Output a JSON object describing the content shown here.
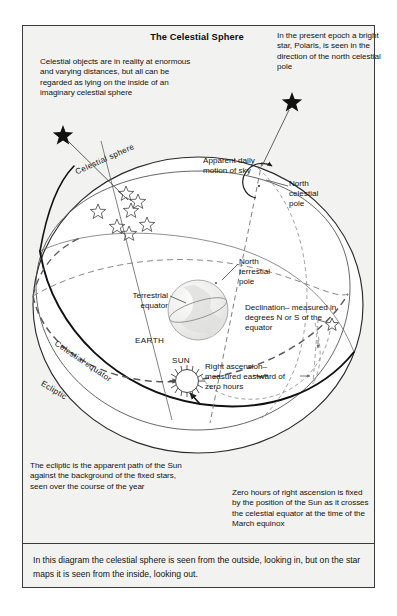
{
  "figure": {
    "title": "The Celestial Sphere",
    "caption": "In this diagram the celestial sphere is seen from the outside, looking in, but on the star maps it is seen from the inside, looking out.",
    "frame_color": "#3a3a3a",
    "background_color": "#f2f2f0",
    "line_color": "#2b2b2b"
  },
  "annotations": {
    "celestial_objects": "Celestial objects are in reality at enormous and varying distances,  but all can be regarded as lying on the inside of an imaginary celestial sphere",
    "polaris": "In the present epoch a bright star, Polaris, is seen in the direction of the north celestial pole",
    "ecliptic_note": "The ecliptic is the apparent path of the Sun against the background of the fixed stars, seen over the course of the year",
    "zero_hours_note": "Zero hours of right ascension is fixed by the position of the Sun as it crosses the celestial equator at the time of the March equinox"
  },
  "labels": {
    "celestial_sphere": "Celestial sphere",
    "apparent_daily_motion": "Apparent daily motion of sky",
    "north_celestial_pole": "North celestial pole",
    "north_terrestrial_pole": "North terrestial pole",
    "declination": "Declination– measured in degrees N or S of the      equator",
    "right_ascension": "Right ascension– measured eastward of zero hours",
    "terrestrial_equator": "Terrestrial equator",
    "earth": "EARTH",
    "sun": "SUN",
    "celestial_equator": "Celestial equator",
    "ecliptic": "Ecliptic"
  },
  "diagram_elements": {
    "stars_upper_cluster": 3,
    "stars_lower_cluster": 3,
    "stars_left": 1,
    "declination_star_glyph": "☆",
    "pointer_star_glyph": "★",
    "sun_rays": 24,
    "sphere_center": [
      198,
      305
    ],
    "sphere_radius_x": 165,
    "sphere_radius_y": 148,
    "earth_center": [
      198,
      310
    ],
    "earth_radius": 30,
    "sun_center": [
      187,
      381
    ],
    "sun_radius": 12
  }
}
